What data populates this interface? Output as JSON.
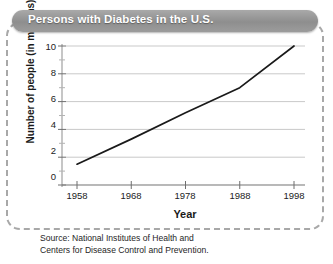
{
  "figure": {
    "title": "Persons with Diabetes in the U.S.",
    "source_line_1": "Source: National Institutes of Health and",
    "source_line_2": "Centers for Disease Control and Prevention.",
    "accent_banner_color": "#9a9a9a",
    "frame_color": "#a8a8a8",
    "line_color": "#1a1a1a",
    "grid_color": "#c9c9c9"
  },
  "chart_data": {
    "type": "line",
    "title": "Persons with Diabetes in the U.S.",
    "xlabel": "Year",
    "ylabel": "Number of people (in millions)",
    "x": [
      1958,
      1968,
      1978,
      1988,
      1998
    ],
    "values": [
      1.5,
      3.3,
      5.2,
      7.0,
      10.0
    ],
    "series": [
      {
        "name": "Persons with Diabetes",
        "values": [
          1.5,
          3.3,
          5.2,
          7.0,
          10.0
        ]
      }
    ],
    "xtick_labels": [
      "1958",
      "1968",
      "1978",
      "1988",
      "1998"
    ],
    "ytick_labels": [
      "0",
      "2",
      "4",
      "6",
      "8",
      "10"
    ],
    "yticks": [
      0,
      2,
      4,
      6,
      8,
      10
    ],
    "yminor_ticks": [
      1,
      3,
      5,
      7,
      9
    ],
    "xlim": [
      1958,
      1998
    ],
    "ylim": [
      0,
      10
    ],
    "grid": "horizontal",
    "legend": "none",
    "markers": false
  }
}
